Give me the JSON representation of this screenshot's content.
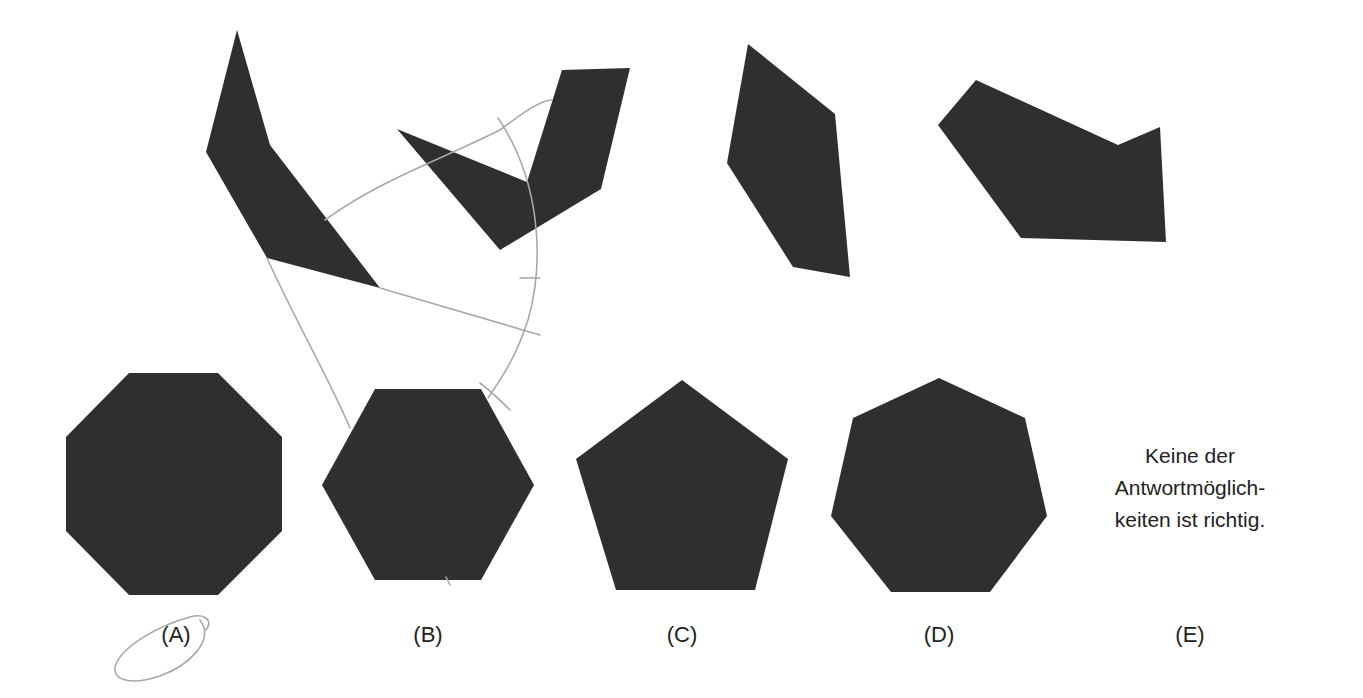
{
  "colors": {
    "shape_fill": "#2f2f2f",
    "pencil": "#a8a8a8",
    "background": "#ffffff",
    "text": "#222222"
  },
  "puzzle_pieces": [
    {
      "id": "piece-1",
      "points": "237,30 270,145 380,288 267,258 206,152"
    },
    {
      "id": "piece-2",
      "points": "397,129 527,182 562,70 630,68 601,189 500,250"
    },
    {
      "id": "piece-3",
      "points": "748,44 835,114 850,277 793,267 727,163"
    },
    {
      "id": "piece-4",
      "points": "976,80 1118,145 1160,127 1166,242 1021,238 938,125"
    }
  ],
  "options": [
    {
      "key": "A",
      "label": "(A)",
      "shape": "octagon",
      "points": "129,373 218,373 282,437 282,531 218,595 129,595 66,531 66,437"
    },
    {
      "key": "B",
      "label": "(B)",
      "shape": "hexagon",
      "points": "375,389 481,389 534,485 481,580 375,580 322,485"
    },
    {
      "key": "C",
      "label": "(C)",
      "shape": "pentagon",
      "points": "682,380 788,459 755,590 616,590 576,459"
    },
    {
      "key": "D",
      "label": "(D)",
      "shape": "heptagon",
      "points": "939,378 1025,418 1047,516 990,592 891,592 831,516 853,418"
    },
    {
      "key": "E",
      "label": "(E)",
      "shape": "text",
      "text_lines": [
        "Keine der",
        "Antwortmöglich-",
        "keiten ist richtig."
      ]
    }
  ],
  "label_positions": {
    "A": [
      176,
      634
    ],
    "B": [
      428,
      634
    ],
    "C": [
      682,
      634
    ],
    "D": [
      939,
      634
    ],
    "E": [
      1190,
      634
    ]
  },
  "pencil_marks": {
    "lines": [
      "M 267 258 C 300 330, 330 380, 350 428",
      "M 380 288 L 540 335",
      "M 325 220 C 380 180, 440 160, 500 130 C 520 115, 540 100, 552 100",
      "M 498 118 C 540 180, 545 260, 528 320 C 515 360, 500 380, 488 398",
      "M 520 278 L 540 278",
      "M 480 383 C 492 392, 502 402, 510 410",
      "M 446 577 L 450 585"
    ],
    "circle_A": "M 200 620 C 215 640, 190 665, 160 676 C 130 686, 110 680, 116 664 C 124 645, 160 625, 190 617 C 204 613, 214 620, 206 630"
  }
}
